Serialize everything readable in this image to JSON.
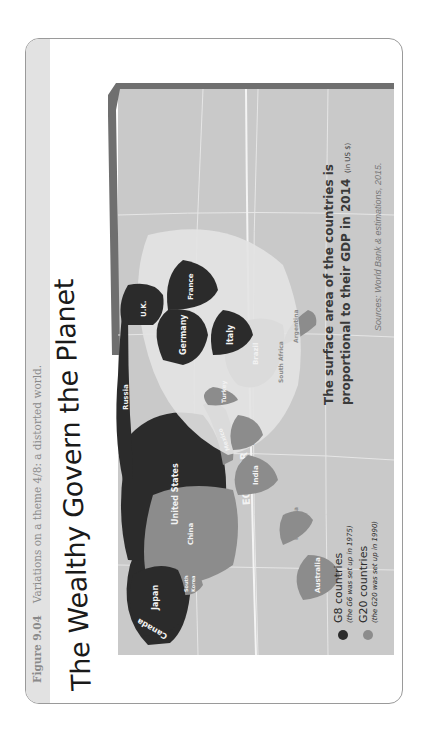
{
  "figure": {
    "number": "Figure 9.04",
    "caption": "Variations on a theme 4/8: a distorted world."
  },
  "map": {
    "title": "The Wealthy Govern the Planet",
    "subtitle_line1": "The surface area of the countries is",
    "subtitle_line2": "proportional to their GDP in 2014",
    "subtitle_unit": "(in US $)",
    "equator_label": "EQUATOR",
    "sources": "Sources: World Bank & estimations, 2015.",
    "legend": [
      {
        "label": "G8 countries",
        "note": "(the G6 was set up in 1975)",
        "color": "#2b2b2b"
      },
      {
        "label": "G20 countries",
        "note": "(the G20 was set up in 1990)",
        "color": "#8c8c8c"
      }
    ],
    "colors": {
      "ocean": "#c9c9c9",
      "g8": "#2b2b2b",
      "g20": "#8c8c8c",
      "other_land": "#e3e3e3",
      "frame_band": "#6f6f6f",
      "grid": "#e8e8e8"
    },
    "countries": {
      "canada": "Canada",
      "united_states": "United States",
      "mexico": "Mexico",
      "brazil": "Brazil",
      "argentina": "Argentina",
      "uk": "U.K.",
      "france": "France",
      "germany": "Germany",
      "italy": "Italy",
      "russia": "Russia",
      "turkey": "Turkey",
      "south_africa": "South Africa",
      "saudi_arabia_1": "Saudi",
      "saudi_arabia_2": "Arabia",
      "india": "India",
      "china": "China",
      "south_korea_1": "South",
      "south_korea_2": "Korea",
      "japan": "Japan",
      "indonesia": "Indonesia",
      "australia": "Australia"
    }
  }
}
